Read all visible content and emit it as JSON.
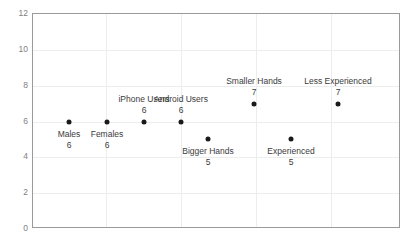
{
  "chart_data": {
    "type": "scatter",
    "title": "",
    "xlabel": "",
    "ylabel": "",
    "ylim": [
      0,
      12
    ],
    "ytick_values": [
      12,
      10,
      8,
      6,
      4,
      2,
      0
    ],
    "ytick_labels": [
      "12",
      "10",
      "8",
      "6",
      "4",
      "2",
      "0"
    ],
    "grid": true,
    "grid_horizontal": true,
    "grid_vertical": true,
    "legend": "none",
    "xtick_labels": [],
    "categories": [
      "Males",
      "Females",
      "iPhone Users",
      "Android Users",
      "Smaller Hands",
      "Bigger Hands",
      "Less Experienced",
      "Experienced"
    ],
    "values": [
      6,
      6,
      6,
      6,
      7,
      5,
      7,
      5
    ],
    "points": [
      {
        "label": "Males",
        "value": 6,
        "value_text": "6",
        "x_px": 68,
        "label_pos": "below"
      },
      {
        "label": "Females",
        "value": 6,
        "value_text": "6",
        "x_px": 106,
        "label_pos": "below"
      },
      {
        "label": "iPhone Users",
        "value": 6,
        "value_text": "6",
        "x_px": 143,
        "label_pos": "above"
      },
      {
        "label": "Android Users",
        "value": 6,
        "value_text": "6",
        "x_px": 180,
        "label_pos": "above"
      },
      {
        "label": "Smaller Hands",
        "value": 7,
        "value_text": "7",
        "x_px": 253,
        "label_pos": "above"
      },
      {
        "label": "Bigger Hands",
        "value": 5,
        "value_text": "5",
        "x_px": 207,
        "label_pos": "below"
      },
      {
        "label": "Less Experienced",
        "value": 7,
        "value_text": "7",
        "x_px": 337,
        "label_pos": "above"
      },
      {
        "label": "Experienced",
        "value": 5,
        "value_text": "5",
        "x_px": 290,
        "label_pos": "below"
      }
    ],
    "colors": {
      "marker": "#1a1a1a",
      "grid": "#eceded",
      "frame": "#9a9a9a",
      "axis_text": "#7f7f7f",
      "label_text": "#3b3b3b",
      "background": "#ffffff"
    }
  }
}
